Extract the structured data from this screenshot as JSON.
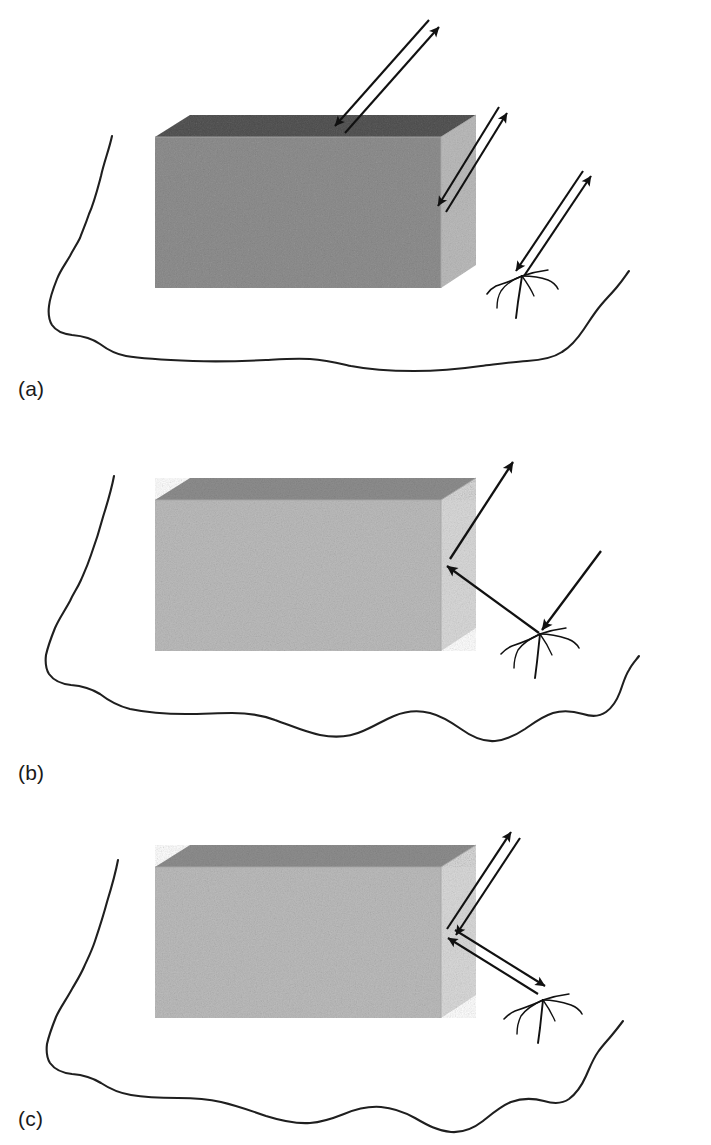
{
  "figure": {
    "kind": "scientific-diagram",
    "background_color": "#ffffff",
    "ink_color": "#1a1a1a",
    "panel_count": 3
  },
  "style": {
    "box_top_face_color": "#8e8e8e",
    "box_front_face_color": "#bcbcbc",
    "box_right_face_color": "#d8d8d8",
    "box_edge_color": "#9a9a9a",
    "terrain_line_color": "#1f1f1f",
    "arrow_color": "#111111",
    "tree_color": "#111111"
  },
  "panels": [
    {
      "id": "panel-a",
      "label": "(a)",
      "label_x": 18,
      "label_y": 378,
      "geometry": "monostatic double-ray paths",
      "ray_count": 3,
      "ray_style": "double-line bidirectional",
      "rays": [
        {
          "name": "ray-top-face",
          "from_x": 434,
          "from_y": 22,
          "to_x": 340,
          "to_y": 128,
          "double": true
        },
        {
          "name": "ray-right-face",
          "from_x": 502,
          "from_y": 110,
          "to_x": 441,
          "to_y": 209,
          "double": true
        },
        {
          "name": "ray-tree",
          "from_x": 586,
          "from_y": 173,
          "to_x": 519,
          "to_y": 273,
          "double": true
        }
      ],
      "has_tree": true,
      "tree_x": 522,
      "tree_y": 275
    },
    {
      "id": "panel-b",
      "label": "(b)",
      "label_x": 18,
      "label_y": 762,
      "geometry": "bistatic single-ray path",
      "ray_count": 3,
      "ray_style": "single-line directional",
      "rays": [
        {
          "name": "ray-box-to-sky",
          "from_x": 450,
          "from_y": 559,
          "to_x": 512,
          "to_y": 463,
          "double": false
        },
        {
          "name": "ray-tree-to-box",
          "from_x": 537,
          "from_y": 633,
          "to_x": 448,
          "to_y": 566,
          "double": false
        },
        {
          "name": "ray-sky-to-tree",
          "from_x": 600,
          "from_y": 551,
          "to_x": 540,
          "to_y": 630,
          "double": false
        }
      ],
      "has_tree": true,
      "tree_x": 540,
      "tree_y": 634
    },
    {
      "id": "panel-c",
      "label": "(c)",
      "label_x": 18,
      "label_y": 1108,
      "geometry": "combined double-ray bistatic path",
      "ray_count": 2,
      "ray_style": "double-line bidirectional",
      "rays": [
        {
          "name": "ray-corner-to-sky",
          "from_x": 515,
          "from_y": 836,
          "to_x": 451,
          "to_y": 924,
          "double": true
        },
        {
          "name": "ray-corner-to-tree",
          "from_x": 451,
          "from_y": 933,
          "to_x": 540,
          "to_y": 1000,
          "double": true
        }
      ],
      "has_tree": true,
      "tree_x": 543,
      "tree_y": 1003
    }
  ],
  "objects": {
    "box": {
      "name": "rectangular block target",
      "panel_a": {
        "left": 155,
        "top": 115,
        "right": 476,
        "front_bottom": 288,
        "top_face_height": 22
      },
      "panel_b": {
        "left": 155,
        "top": 478,
        "right": 476,
        "front_bottom": 651,
        "top_face_height": 22
      },
      "panel_c": {
        "left": 155,
        "top": 845,
        "right": 476,
        "front_bottom": 1018,
        "top_face_height": 22
      }
    },
    "tree": {
      "name": "bare tree / shrub symbol",
      "style": "sparse hand-drawn branching lines"
    },
    "terrain": {
      "name": "undulating ground outline",
      "style": "hand-drawn wavy closed-ended contour"
    }
  }
}
